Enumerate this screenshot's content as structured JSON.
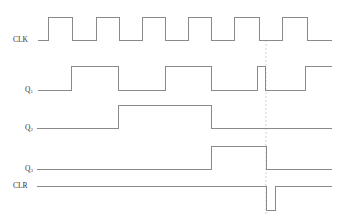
{
  "diagram": {
    "title": "",
    "type": "timing-diagram",
    "colors": {
      "wave": "#8a8a8a",
      "dashed": "#c8c8c8",
      "label": "#333333",
      "background": "#ffffff"
    },
    "signals": [
      {
        "id": "clk",
        "label": "CLK",
        "sub": "",
        "label_y": 40,
        "high_y": 17,
        "low_y": 40,
        "points": [
          [
            38,
            40
          ],
          [
            48,
            40
          ],
          [
            48,
            17
          ],
          [
            72,
            17
          ],
          [
            72,
            40
          ],
          [
            96,
            40
          ],
          [
            96,
            17
          ],
          [
            119,
            17
          ],
          [
            119,
            40
          ],
          [
            142,
            40
          ],
          [
            142,
            17
          ],
          [
            165,
            17
          ],
          [
            165,
            40
          ],
          [
            188,
            40
          ],
          [
            188,
            17
          ],
          [
            211,
            17
          ],
          [
            211,
            40
          ],
          [
            234,
            40
          ],
          [
            234,
            17
          ],
          [
            259,
            17
          ],
          [
            259,
            40
          ],
          [
            282,
            40
          ],
          [
            282,
            17
          ],
          [
            307,
            17
          ],
          [
            307,
            40
          ],
          [
            332,
            40
          ]
        ]
      },
      {
        "id": "q1",
        "label": "Q",
        "sub": "1",
        "label_y": 90,
        "high_y": 66,
        "low_y": 90,
        "points": [
          [
            38,
            90
          ],
          [
            71,
            90
          ],
          [
            71,
            66
          ],
          [
            118,
            66
          ],
          [
            118,
            90
          ],
          [
            165,
            90
          ],
          [
            165,
            66
          ],
          [
            211,
            66
          ],
          [
            211,
            90
          ],
          [
            257,
            90
          ],
          [
            257,
            66
          ],
          [
            265,
            66
          ],
          [
            265,
            90
          ],
          [
            305,
            90
          ],
          [
            305,
            66
          ],
          [
            332,
            66
          ]
        ]
      },
      {
        "id": "q2",
        "label": "Q",
        "sub": "2",
        "label_y": 128,
        "high_y": 105,
        "low_y": 128,
        "points": [
          [
            37,
            128
          ],
          [
            118,
            128
          ],
          [
            118,
            105
          ],
          [
            211,
            105
          ],
          [
            211,
            128
          ],
          [
            332,
            128
          ]
        ]
      },
      {
        "id": "q3",
        "label": "Q",
        "sub": "3",
        "label_y": 169,
        "high_y": 146,
        "low_y": 169,
        "points": [
          [
            37,
            169
          ],
          [
            211,
            169
          ],
          [
            211,
            146
          ],
          [
            266,
            146
          ],
          [
            266,
            169
          ],
          [
            332,
            169
          ]
        ]
      },
      {
        "id": "clr",
        "label": "CLR",
        "sub": "",
        "label_y": 186,
        "high_y": 186,
        "low_y": 210,
        "points": [
          [
            37,
            186
          ],
          [
            266,
            186
          ],
          [
            266,
            210
          ],
          [
            275,
            210
          ],
          [
            275,
            186
          ],
          [
            332,
            186
          ]
        ]
      }
    ],
    "marker": {
      "x": 266,
      "y1": 40,
      "y2": 216,
      "style": "dashed"
    }
  }
}
